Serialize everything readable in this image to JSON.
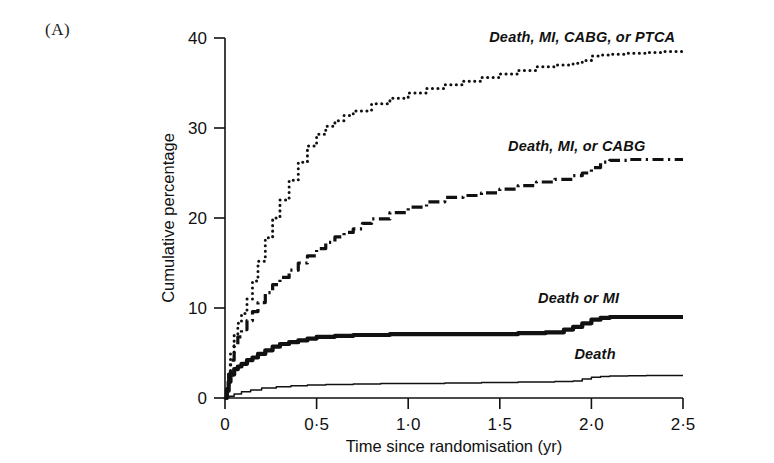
{
  "panel": {
    "label": "(A)"
  },
  "chart_data": {
    "type": "line",
    "title": "",
    "xlabel": "Time since randomisation (yr)",
    "ylabel": "Cumulative percentage",
    "xlim": [
      0,
      2.5
    ],
    "ylim": [
      0,
      40
    ],
    "grid": false,
    "legend_position": "inline-right",
    "xticks": [
      0,
      0.5,
      1.0,
      1.5,
      2.0,
      2.5
    ],
    "xtick_labels": [
      "0",
      "0·5",
      "1·0",
      "1·5",
      "2·0",
      "2·5"
    ],
    "yticks": [
      0,
      10,
      20,
      30,
      40
    ],
    "ytick_labels": [
      "0",
      "10",
      "20",
      "30",
      "40"
    ],
    "series": [
      {
        "name": "Death, MI, CABG, or PTCA",
        "style": "dotted",
        "label_x": 1.95,
        "label_y": 39.6,
        "x": [
          0,
          0.01,
          0.02,
          0.03,
          0.05,
          0.07,
          0.09,
          0.12,
          0.15,
          0.18,
          0.22,
          0.26,
          0.3,
          0.35,
          0.4,
          0.45,
          0.5,
          0.55,
          0.6,
          0.65,
          0.7,
          0.8,
          0.9,
          1.0,
          1.1,
          1.2,
          1.3,
          1.4,
          1.5,
          1.6,
          1.7,
          1.8,
          1.9,
          1.95,
          2.0,
          2.05,
          2.1,
          2.2,
          2.3,
          2.4,
          2.5
        ],
        "y": [
          0,
          1.2,
          3.0,
          5.0,
          7.0,
          8.3,
          9.4,
          11.0,
          13.0,
          15.2,
          17.8,
          20.0,
          22.0,
          24.2,
          26.2,
          28.0,
          29.3,
          30.2,
          30.8,
          31.4,
          31.9,
          32.7,
          33.3,
          33.9,
          34.4,
          34.8,
          35.2,
          35.6,
          36.0,
          36.4,
          36.8,
          37.0,
          37.2,
          37.5,
          38.0,
          38.1,
          38.2,
          38.3,
          38.4,
          38.5,
          38.5
        ]
      },
      {
        "name": "Death, MI, or CABG",
        "style": "dashdot",
        "label_x": 1.92,
        "label_y": 27.4,
        "x": [
          0,
          0.01,
          0.02,
          0.03,
          0.05,
          0.07,
          0.09,
          0.12,
          0.15,
          0.18,
          0.22,
          0.26,
          0.3,
          0.35,
          0.4,
          0.45,
          0.5,
          0.55,
          0.6,
          0.65,
          0.7,
          0.75,
          0.8,
          0.9,
          1.0,
          1.1,
          1.2,
          1.3,
          1.4,
          1.5,
          1.6,
          1.7,
          1.8,
          1.9,
          1.95,
          2.0,
          2.05,
          2.1,
          2.2,
          2.3,
          2.4,
          2.5
        ],
        "y": [
          0,
          1.0,
          2.6,
          4.2,
          5.8,
          6.8,
          7.6,
          8.6,
          9.6,
          10.6,
          11.7,
          12.6,
          13.4,
          14.2,
          15.0,
          15.8,
          16.6,
          17.3,
          17.9,
          18.4,
          18.8,
          19.4,
          19.9,
          20.6,
          21.2,
          21.8,
          22.3,
          22.5,
          22.8,
          23.2,
          23.6,
          24.0,
          24.3,
          24.7,
          25.0,
          25.6,
          26.2,
          26.4,
          26.5,
          26.5,
          26.5,
          26.5
        ]
      },
      {
        "name": "Death or MI",
        "style": "thick-solid",
        "label_x": 1.93,
        "label_y": 10.6,
        "x": [
          0,
          0.01,
          0.02,
          0.03,
          0.05,
          0.07,
          0.09,
          0.12,
          0.15,
          0.18,
          0.22,
          0.26,
          0.3,
          0.35,
          0.4,
          0.45,
          0.5,
          0.6,
          0.7,
          0.8,
          0.9,
          1.0,
          1.2,
          1.4,
          1.6,
          1.75,
          1.85,
          1.9,
          1.95,
          2.0,
          2.05,
          2.1,
          2.2,
          2.3,
          2.4,
          2.5
        ],
        "y": [
          0,
          0.8,
          1.8,
          2.6,
          3.2,
          3.5,
          3.8,
          4.2,
          4.5,
          4.9,
          5.3,
          5.7,
          6.0,
          6.2,
          6.4,
          6.6,
          6.8,
          6.9,
          7.0,
          7.0,
          7.1,
          7.1,
          7.1,
          7.1,
          7.2,
          7.3,
          7.6,
          7.9,
          8.3,
          8.7,
          8.9,
          9.0,
          9.0,
          9.0,
          9.0,
          9.0
        ]
      },
      {
        "name": "Death",
        "style": "thin-solid",
        "label_x": 2.02,
        "label_y": 4.3,
        "x": [
          0,
          0.02,
          0.05,
          0.09,
          0.14,
          0.2,
          0.28,
          0.36,
          0.45,
          0.55,
          0.7,
          0.85,
          1.0,
          1.2,
          1.4,
          1.6,
          1.8,
          1.9,
          1.95,
          2.0,
          2.05,
          2.1,
          2.2,
          2.3,
          2.4,
          2.5
        ],
        "y": [
          0,
          0.2,
          0.45,
          0.7,
          0.9,
          1.1,
          1.25,
          1.35,
          1.45,
          1.5,
          1.55,
          1.6,
          1.62,
          1.68,
          1.72,
          1.78,
          1.82,
          1.9,
          2.1,
          2.3,
          2.4,
          2.45,
          2.48,
          2.5,
          2.5,
          2.5
        ]
      }
    ]
  }
}
